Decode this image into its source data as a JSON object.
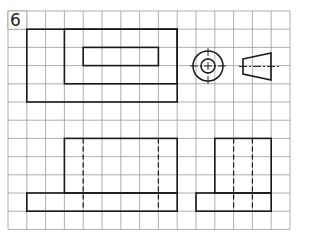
{
  "exercise": {
    "number": "6",
    "title": "Orthographic projection exercise"
  },
  "grid": {
    "left": 8,
    "top": 11,
    "cols": 15,
    "rows": 12,
    "cell_w": 18.8,
    "cell_h": 18.2,
    "line_color": "#9a9a9a",
    "border_color": "#888888"
  },
  "drawing": {
    "stroke_color": "#1a1a1a",
    "views": [
      {
        "name": "front-view-top",
        "rects": [
          [
            1,
            1,
            9,
            5
          ],
          [
            3,
            1,
            9,
            4
          ],
          [
            4,
            2,
            8,
            3
          ]
        ]
      },
      {
        "name": "top-view-circles",
        "center": [
          208,
          66
        ],
        "outer_r": 15,
        "inner_r": 7
      },
      {
        "name": "side-view-trapezoid",
        "points": [
          [
            243,
            59
          ],
          [
            271,
            53
          ],
          [
            271,
            80
          ],
          [
            243,
            74
          ]
        ]
      },
      {
        "name": "front-view-bottom",
        "rects": [
          [
            3,
            7,
            9,
            10
          ],
          [
            1,
            10,
            9,
            11
          ]
        ],
        "hidden_cols": [
          4,
          8
        ]
      },
      {
        "name": "side-view-bottom",
        "rects": [
          [
            11,
            7,
            14,
            10
          ],
          [
            10,
            10,
            14,
            11
          ]
        ],
        "hidden_cols": [
          12,
          13
        ]
      }
    ]
  }
}
